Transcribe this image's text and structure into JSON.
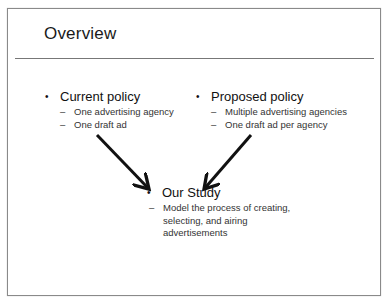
{
  "slide": {
    "title": "Overview",
    "bullets": [
      {
        "label": "Current policy",
        "bullet_glyph": "•",
        "sub_items": [
          "One advertising agency",
          "One draft ad"
        ]
      },
      {
        "label": "Proposed policy",
        "bullet_glyph": "•",
        "sub_items": [
          "Multiple advertising agencies",
          "One draft ad per agency"
        ]
      },
      {
        "label": "Our Study",
        "bullet_glyph": "•",
        "sub_items": [
          "Model the process of creating, selecting, and airing advertisements"
        ]
      }
    ],
    "sub_glyph": "–",
    "arrows": [
      {
        "name": "current-to-study",
        "from": [
          97,
          135
        ],
        "to": [
          150,
          190
        ]
      },
      {
        "name": "proposed-to-study",
        "from": [
          251,
          135
        ],
        "to": [
          203,
          190
        ]
      }
    ],
    "colors": {
      "text": "#111111",
      "rule": "#777777",
      "arrow": "#111111",
      "frame": "#8a8a8a"
    }
  }
}
